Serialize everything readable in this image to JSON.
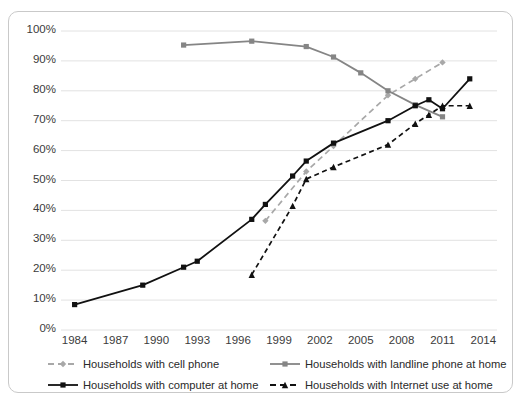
{
  "chart_data": {
    "type": "line",
    "title": "",
    "xlabel": "",
    "ylabel": "",
    "xlim": [
      1983,
      2015
    ],
    "ylim": [
      0,
      100
    ],
    "grid": "horizontal",
    "legend_position": "bottom",
    "y_ticks": [
      "0%",
      "10%",
      "20%",
      "30%",
      "40%",
      "50%",
      "60%",
      "70%",
      "80%",
      "90%",
      "100%"
    ],
    "y_tick_values": [
      0,
      10,
      20,
      30,
      40,
      50,
      60,
      70,
      80,
      90,
      100
    ],
    "x_ticks": [
      "1984",
      "1987",
      "1990",
      "1993",
      "1996",
      "1999",
      "2002",
      "2005",
      "2008",
      "2011",
      "2014"
    ],
    "x_tick_values": [
      1984,
      1987,
      1990,
      1993,
      1996,
      1999,
      2002,
      2005,
      2008,
      2011,
      2014
    ],
    "series": [
      {
        "name": "Households with cell phone",
        "color": "#a8a8a8",
        "style": "dashed",
        "marker": "diamond",
        "x": [
          1998,
          2001,
          2003,
          2007,
          2009,
          2011
        ],
        "values": [
          36.5,
          53.0,
          61.5,
          78.5,
          84.0,
          89.5
        ]
      },
      {
        "name": "Households with landline phone at home",
        "color": "#858585",
        "style": "solid",
        "marker": "square",
        "x": [
          1992,
          1997,
          2001,
          2003,
          2005,
          2007,
          2009,
          2011
        ],
        "values": [
          95.3,
          96.6,
          94.8,
          91.3,
          86.0,
          80.0,
          75.3,
          71.3
        ]
      },
      {
        "name": "Households with computer at home",
        "color": "#111111",
        "style": "solid",
        "marker": "square",
        "x": [
          1984,
          1989,
          1992,
          1993,
          1997,
          1998,
          2000,
          2001,
          2003,
          2007,
          2009,
          2010,
          2011,
          2013
        ],
        "values": [
          8.5,
          15.0,
          21.0,
          23.0,
          37.0,
          42.0,
          51.5,
          56.5,
          62.5,
          70.0,
          75.0,
          77.0,
          74.0,
          84.0
        ]
      },
      {
        "name": "Households with Internet use at home",
        "color": "#111111",
        "style": "dashed",
        "marker": "triangle",
        "x": [
          1997,
          2000,
          2001,
          2003,
          2007,
          2009,
          2010,
          2011,
          2013
        ],
        "values": [
          18.5,
          41.5,
          50.5,
          54.5,
          62.0,
          69.0,
          72.0,
          75.0,
          75.0
        ]
      }
    ]
  },
  "legend": {
    "items": [
      {
        "label": "Households with cell phone"
      },
      {
        "label": "Households with landline phone at home"
      },
      {
        "label": "Households with computer at home"
      },
      {
        "label": "Households with Internet use at home"
      }
    ]
  }
}
